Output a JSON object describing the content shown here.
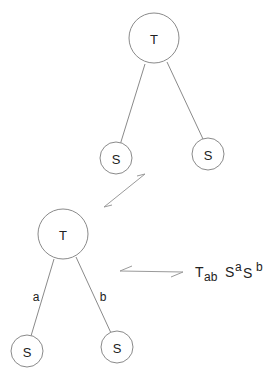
{
  "diagram": {
    "top_tree": {
      "root": {
        "label": "T"
      },
      "children": [
        {
          "label": "S",
          "edge_label": ""
        },
        {
          "label": "S",
          "edge_label": ""
        }
      ]
    },
    "bottom_tree": {
      "root": {
        "label": "T"
      },
      "children": [
        {
          "label": "S",
          "edge_label": "a"
        },
        {
          "label": "S",
          "edge_label": "b"
        }
      ]
    },
    "formula": {
      "base": "T",
      "base_sub": "ab",
      "s1": "S",
      "s1_sup": "a",
      "s2": "S",
      "s2_sup": "b"
    },
    "arrows": [
      {
        "name": "equivalence-arrow-diagonal",
        "type": "harpoon-pair"
      },
      {
        "name": "equivalence-arrow-horizontal",
        "type": "harpoon-pair"
      }
    ]
  }
}
